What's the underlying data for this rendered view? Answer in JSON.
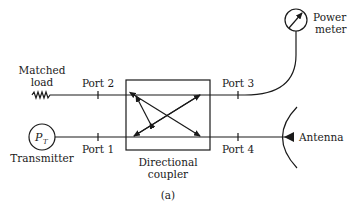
{
  "diagram": {
    "caption": "(a)",
    "coupler": {
      "label_line1": "Directional",
      "label_line2": "coupler"
    },
    "ports": {
      "port1": "Port 1",
      "port2": "Port 2",
      "port3": "Port 3",
      "port4": "Port 4"
    },
    "components": {
      "matched_load": {
        "line1": "Matched",
        "line2": "load"
      },
      "power_meter": {
        "line1": "Power",
        "line2": "meter"
      },
      "transmitter": {
        "label": "Transmitter",
        "symbol": "P",
        "subscript": "T"
      },
      "antenna": {
        "label": "Antenna"
      }
    }
  }
}
